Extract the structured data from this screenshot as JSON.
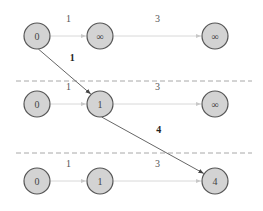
{
  "diagram": {
    "title": "",
    "stages": [
      {
        "nodes": [
          {
            "id": "A",
            "label": "0"
          },
          {
            "id": "B",
            "label": "∞"
          },
          {
            "id": "C",
            "label": "∞"
          }
        ],
        "edges": [
          {
            "from": "A",
            "to": "B",
            "weight": "1"
          },
          {
            "from": "B",
            "to": "C",
            "weight": "3"
          }
        ]
      },
      {
        "nodes": [
          {
            "id": "A",
            "label": "0"
          },
          {
            "id": "B",
            "label": "1"
          },
          {
            "id": "C",
            "label": "∞"
          }
        ],
        "edges": [
          {
            "from": "A",
            "to": "B",
            "weight": "1"
          },
          {
            "from": "B",
            "to": "C",
            "weight": "3"
          }
        ]
      },
      {
        "nodes": [
          {
            "id": "A",
            "label": "0"
          },
          {
            "id": "B",
            "label": "1"
          },
          {
            "id": "C",
            "label": "4"
          }
        ],
        "edges": [
          {
            "from": "A",
            "to": "B",
            "weight": "1"
          },
          {
            "from": "B",
            "to": "C",
            "weight": "3"
          }
        ]
      }
    ],
    "transitions": [
      {
        "from_stage": 0,
        "from_node": "A",
        "to_stage": 1,
        "to_node": "B",
        "weight": "1"
      },
      {
        "from_stage": 1,
        "from_node": "B",
        "to_stage": 2,
        "to_node": "C",
        "weight": "4"
      }
    ],
    "colors": {
      "node_fill": "#d3d3d3",
      "node_stroke": "#555555",
      "light_edge": "#d8d8d8",
      "dark_edge": "#555555",
      "divider": "#a8a8a8"
    }
  }
}
